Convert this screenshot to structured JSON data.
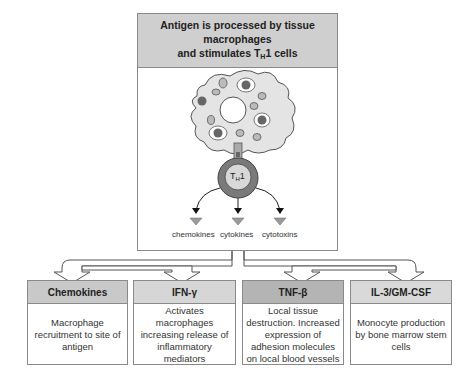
{
  "header": {
    "line1": "Antigen is processed by tissue macrophages",
    "line2_prefix": "and stimulates T",
    "line2_sub": "H",
    "line2_suffix": "1 cells"
  },
  "cell": {
    "label_prefix": "T",
    "label_sub": "H",
    "label_suffix": "1"
  },
  "products": [
    {
      "label": "chemokines"
    },
    {
      "label": "cytokines"
    },
    {
      "label": "cytotoxins"
    }
  ],
  "effects": [
    {
      "title": "Chemokines",
      "description": "Macrophage recruitment to site of antigen",
      "header_color": "#c9c9c9"
    },
    {
      "title": "IFN-γ",
      "description": "Activates macrophages increasing release of inflammatory mediators",
      "header_color": "#d6d6d6"
    },
    {
      "title": "TNF-β",
      "description": "Local tissue destruction. Increased expression of adhesion molecules on local blood vessels",
      "header_color": "#b4b4b4"
    },
    {
      "title": "IL-3/GM-CSF",
      "description": "Monocyte production by bone marrow stem cells",
      "header_color": "#d9d9d9"
    }
  ],
  "colors": {
    "macrophage_fill": "#e4e4e4",
    "cell_outer": "#7a7a7a",
    "cell_inner": "#d8d8d8",
    "vesicle": "#999999",
    "triangle": "#9a9a9a"
  }
}
